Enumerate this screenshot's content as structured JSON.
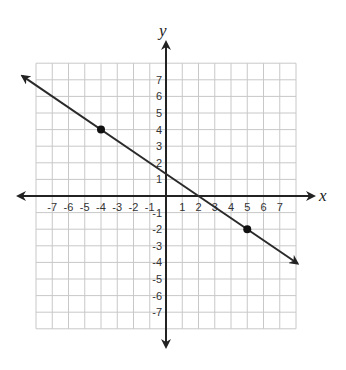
{
  "chart_data": {
    "type": "line",
    "title": "",
    "xlabel": "x",
    "ylabel": "y",
    "xlim": [
      -8,
      8
    ],
    "ylim": [
      -8,
      8
    ],
    "grid": true,
    "x_ticks": [
      -7,
      -6,
      -5,
      -4,
      -3,
      -2,
      -1,
      1,
      2,
      3,
      4,
      5,
      6,
      7
    ],
    "y_ticks": [
      -7,
      -6,
      -5,
      -4,
      -3,
      -2,
      -1,
      1,
      2,
      3,
      4,
      5,
      6,
      7
    ],
    "series": [
      {
        "name": "line",
        "kind": "line-with-arrows",
        "slope": -0.6667,
        "intercept": 1.3333,
        "points": [
          {
            "x": -4,
            "y": 4
          },
          {
            "x": 5,
            "y": -2
          }
        ]
      }
    ],
    "colors": {
      "grid": "#c8c8c8",
      "axis": "#222222",
      "line": "#2a2a2a",
      "point": "#111111"
    }
  }
}
